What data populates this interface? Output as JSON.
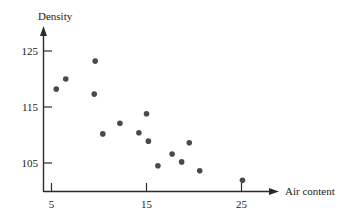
{
  "chart_data": {
    "type": "scatter",
    "title": "",
    "subtitle": "",
    "xlabel": "Air content",
    "ylabel": "Density",
    "xlim": [
      3.0,
      28.5
    ],
    "ylim": [
      100.5,
      126.5
    ],
    "xticks": [
      5,
      15,
      25
    ],
    "xtick_labels": [
      "5",
      "15",
      "25"
    ],
    "yticks": [
      105,
      115,
      125
    ],
    "ytick_labels": [
      "105",
      "115",
      "125"
    ],
    "grid": false,
    "legend": null,
    "point_color": "#4a4a4a",
    "axis_color": "#2b2b2b",
    "background_color": "#ffffff",
    "n_points": 15,
    "series": [
      {
        "name": "observations",
        "points": [
          {
            "x": 5.5,
            "y": 118.2
          },
          {
            "x": 6.5,
            "y": 120.0
          },
          {
            "x": 9.6,
            "y": 123.2
          },
          {
            "x": 9.5,
            "y": 117.3
          },
          {
            "x": 10.4,
            "y": 110.2
          },
          {
            "x": 12.2,
            "y": 112.1
          },
          {
            "x": 14.2,
            "y": 110.4
          },
          {
            "x": 15.0,
            "y": 113.8
          },
          {
            "x": 15.2,
            "y": 108.9
          },
          {
            "x": 16.2,
            "y": 104.5
          },
          {
            "x": 17.7,
            "y": 106.6
          },
          {
            "x": 18.7,
            "y": 105.2
          },
          {
            "x": 19.5,
            "y": 108.6
          },
          {
            "x": 20.6,
            "y": 103.6
          },
          {
            "x": 25.1,
            "y": 101.9
          }
        ]
      }
    ]
  },
  "labels": {
    "y_axis_title": "Density",
    "x_axis_title": "Air content",
    "y_tick_125": "125",
    "y_tick_115": "115",
    "y_tick_105": "105",
    "x_tick_5": "5",
    "x_tick_15": "15",
    "x_tick_25": "25"
  }
}
